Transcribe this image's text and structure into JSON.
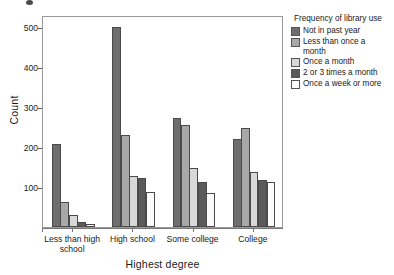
{
  "chart_data": {
    "type": "bar",
    "title": "",
    "subtitle": "",
    "xlabel": "Highest degree",
    "ylabel": "Count",
    "categories": [
      "Less than high\nschool",
      "High school",
      "Some college",
      "College"
    ],
    "legend_title": "Frequency of library use",
    "legend_position": "right",
    "grid": false,
    "ylim": [
      0,
      530
    ],
    "yticks": [
      100,
      200,
      300,
      400,
      500
    ],
    "ytick_labels": [
      "100",
      "200",
      "300",
      "400",
      "500"
    ],
    "series": [
      {
        "name": "Not in past year",
        "color": "#6e6e6e",
        "values": [
          208,
          500,
          272,
          219
        ]
      },
      {
        "name": "Less than once a\nmonth",
        "color": "#a8a8a8",
        "values": [
          62,
          230,
          255,
          247
        ]
      },
      {
        "name": "Once a month",
        "color": "#d8d8d8",
        "values": [
          30,
          127,
          148,
          138
        ]
      },
      {
        "name": "2 or 3 times a month",
        "color": "#5a5a5a",
        "values": [
          12,
          123,
          112,
          117
        ]
      },
      {
        "name": "Once a week or more",
        "color": "#fbfbfb",
        "values": [
          8,
          87,
          85,
          112
        ]
      }
    ]
  },
  "axes": {
    "ylabel": "Count",
    "xlabel": "Highest degree"
  },
  "legend": {
    "title": "Frequency of library use"
  }
}
